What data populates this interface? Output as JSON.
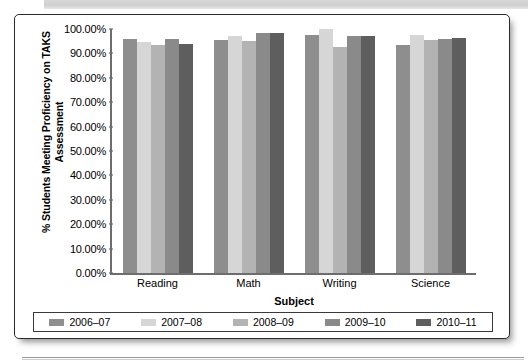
{
  "chart_data": {
    "type": "bar",
    "title": "",
    "xlabel": "Subject",
    "ylabel": "% Students Meeting Proficiency on TAKS Assessment",
    "categories": [
      "Reading",
      "Math",
      "Writing",
      "Science"
    ],
    "ylim": [
      0,
      100
    ],
    "ytick_labels": [
      "100.00%",
      "90.00%",
      "80.00%",
      "70.00%",
      "60.00%",
      "50.00%",
      "40.00%",
      "30.00%",
      "20.00%",
      "10.00%",
      "0.00%"
    ],
    "ytick_values": [
      100,
      90,
      80,
      70,
      60,
      50,
      40,
      30,
      20,
      10,
      0
    ],
    "grid": false,
    "legend_position": "bottom",
    "series": [
      {
        "name": "2006–07",
        "color": "#8e8e8e",
        "values": [
          96.0,
          95.5,
          97.5,
          93.5
        ]
      },
      {
        "name": "2007–08",
        "color": "#d6d6d6",
        "values": [
          94.5,
          97.0,
          100.0,
          97.5
        ]
      },
      {
        "name": "2008–09",
        "color": "#b3b3b3",
        "values": [
          93.5,
          95.0,
          92.5,
          95.5
        ]
      },
      {
        "name": "2009–10",
        "color": "#8a8a8a",
        "values": [
          96.0,
          98.5,
          97.0,
          96.0
        ]
      },
      {
        "name": "2010–11",
        "color": "#5e5e5e",
        "values": [
          94.0,
          98.5,
          97.0,
          96.5
        ]
      }
    ]
  },
  "legend": {
    "items": [
      {
        "label": "2006–07",
        "color": "#8e8e8e"
      },
      {
        "label": "2007–08",
        "color": "#d6d6d6"
      },
      {
        "label": "2008–09",
        "color": "#b3b3b3"
      },
      {
        "label": "2009–10",
        "color": "#8a8a8a"
      },
      {
        "label": "2010–11",
        "color": "#5e5e5e"
      }
    ]
  }
}
